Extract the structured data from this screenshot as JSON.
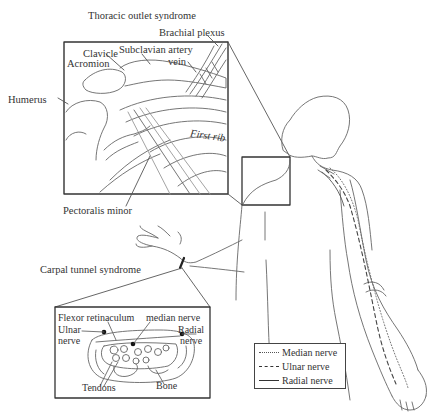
{
  "figure": {
    "title_top": "Thoracic outlet syndrome",
    "title_bottom": "Carpal tunnel syndrome"
  },
  "thoracic_inset": {
    "labels": {
      "brachial_plexus": "Brachial plexus",
      "clavicle": "Clavicle",
      "subclavian_artery": "Subclavian artery",
      "vein": "vein",
      "acromion": "Acromion",
      "humerus": "Humerus",
      "first_rib": "First rib",
      "pectoralis_minor": "Pectoralis minor"
    }
  },
  "carpal_inset": {
    "labels": {
      "flexor_retinaculum": "Flexor retinaculum",
      "median_nerve": "median nerve",
      "ulnar_nerve_line1": "Ulnar",
      "ulnar_nerve_line2": "nerve",
      "radial_nerve_line1": "Radial",
      "radial_nerve_line2": "nerve",
      "tendons": "Tendons",
      "bone": "Bone"
    }
  },
  "legend": {
    "items": [
      {
        "style": "dotted",
        "label": "Median nerve"
      },
      {
        "style": "dashed",
        "label": "Ulnar nerve"
      },
      {
        "style": "solid",
        "label": "Radial nerve"
      }
    ]
  },
  "colors": {
    "line": "#555555",
    "box": "#333333",
    "text": "#333333",
    "background": "#ffffff"
  }
}
